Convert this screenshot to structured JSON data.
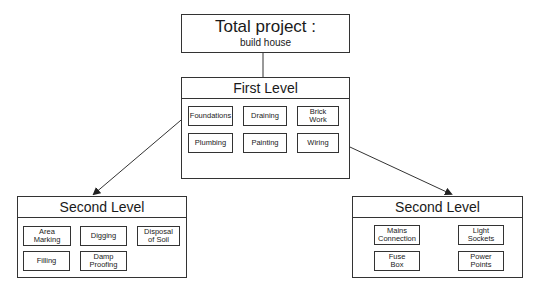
{
  "root": {
    "title": "Total project :",
    "subtitle": "build house"
  },
  "first_level": {
    "title": "First Level",
    "items": [
      "Foundations",
      "Draining",
      "Brick\nWork",
      "Plumbing",
      "Painting",
      "Wiring"
    ]
  },
  "second_level_left": {
    "title": "Second Level",
    "parent": "Foundations",
    "items": [
      "Area\nMarking",
      "Digging",
      "Disposal\nof Soil",
      "Filling",
      "Damp\nProofing"
    ]
  },
  "second_level_right": {
    "title": "Second Level",
    "parent": "Wiring",
    "items": [
      "Mains\nConnection",
      "Light\nSockets",
      "Fuse\nBox",
      "Power\nPoints"
    ]
  },
  "colors": {
    "line": "#333333",
    "background": "#ffffff"
  }
}
